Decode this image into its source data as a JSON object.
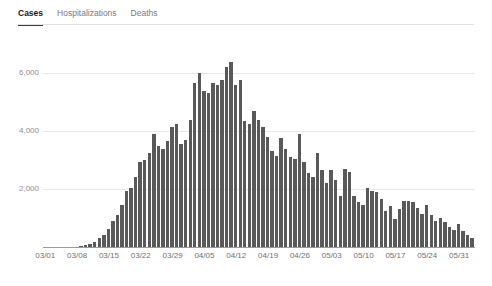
{
  "tabs": [
    {
      "label": "Cases",
      "active": true
    },
    {
      "label": "Hospitalizations",
      "active": false
    },
    {
      "label": "Deaths",
      "active": false
    }
  ],
  "caption": "",
  "colors": {
    "bar": "#595959",
    "gridline": "#e8e8e8",
    "axis": "#9a9a9a",
    "active_tab": "#1a1a1a",
    "inactive_tab": "#7a7a7a"
  },
  "chart_data": {
    "type": "bar",
    "title": "",
    "xlabel": "",
    "ylabel": "",
    "ylim": [
      0,
      6800
    ],
    "grid": true,
    "legend": "none",
    "yticks": [
      2000,
      4000,
      6000
    ],
    "ytick_labels": [
      "2,000",
      "4,000",
      "6,000"
    ],
    "xtick_labels": [
      "03/01",
      "03/08",
      "03/15",
      "03/22",
      "03/29",
      "04/05",
      "04/12",
      "04/19",
      "04/26",
      "05/03",
      "05/10",
      "05/17",
      "05/24",
      "05/31"
    ],
    "xtick_indices": [
      0,
      7,
      14,
      21,
      28,
      35,
      42,
      49,
      56,
      63,
      70,
      77,
      84,
      91
    ],
    "categories": [
      "03/01",
      "03/02",
      "03/03",
      "03/04",
      "03/05",
      "03/06",
      "03/07",
      "03/08",
      "03/09",
      "03/10",
      "03/11",
      "03/12",
      "03/13",
      "03/14",
      "03/15",
      "03/16",
      "03/17",
      "03/18",
      "03/19",
      "03/20",
      "03/21",
      "03/22",
      "03/23",
      "03/24",
      "03/25",
      "03/26",
      "03/27",
      "03/28",
      "03/29",
      "03/30",
      "03/31",
      "04/01",
      "04/02",
      "04/03",
      "04/04",
      "04/05",
      "04/06",
      "04/07",
      "04/08",
      "04/09",
      "04/10",
      "04/11",
      "04/12",
      "04/13",
      "04/14",
      "04/15",
      "04/16",
      "04/17",
      "04/18",
      "04/19",
      "04/20",
      "04/21",
      "04/22",
      "04/23",
      "04/24",
      "04/25",
      "04/26",
      "04/27",
      "04/28",
      "04/29",
      "04/30",
      "05/01",
      "05/02",
      "05/03",
      "05/04",
      "05/05",
      "05/06",
      "05/07",
      "05/08",
      "05/09",
      "05/10",
      "05/11",
      "05/12",
      "05/13",
      "05/14",
      "05/15",
      "05/16",
      "05/17",
      "05/18",
      "05/19",
      "05/20",
      "05/21",
      "05/22",
      "05/23",
      "05/24",
      "05/25",
      "05/26",
      "05/27",
      "05/28",
      "05/29",
      "05/30",
      "05/31",
      "06/01",
      "06/02",
      "06/03"
    ],
    "values": [
      0,
      0,
      0,
      0,
      0,
      0,
      0,
      0,
      30,
      60,
      110,
      180,
      300,
      430,
      620,
      900,
      1100,
      1450,
      1950,
      2050,
      2400,
      2950,
      3000,
      3250,
      3900,
      3500,
      3400,
      3650,
      4150,
      4250,
      3550,
      3700,
      4400,
      5650,
      6000,
      5400,
      5300,
      5650,
      5600,
      5750,
      6200,
      6400,
      5600,
      5750,
      4350,
      4250,
      4700,
      4400,
      4150,
      3800,
      3300,
      3150,
      3750,
      3400,
      3100,
      3050,
      3900,
      2950,
      2550,
      2400,
      3250,
      2650,
      2200,
      2650,
      2300,
      1750,
      2700,
      2600,
      1750,
      1550,
      1450,
      2050,
      1950,
      1900,
      1650,
      1250,
      1400,
      950,
      1300,
      1600,
      1600,
      1550,
      1350,
      1150,
      1450,
      1100,
      900,
      1000,
      850,
      700,
      600,
      800,
      550,
      400,
      300
    ]
  }
}
